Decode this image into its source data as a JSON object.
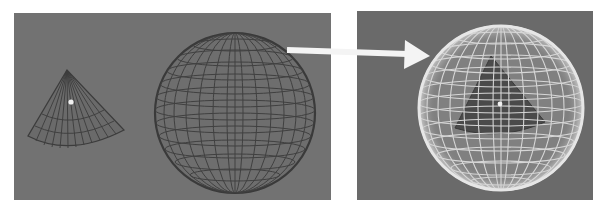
{
  "figure": {
    "colors": {
      "page_background": "#ffffff",
      "viewport_background": "#6e6e6e",
      "wire_dark": "#3a3a3a",
      "wire_light": "#e2e2e2",
      "arrow": "#f4f4f4",
      "pivot_dot": "#f0f0f0"
    },
    "panels": [
      {
        "id": "before",
        "label": "",
        "objects": [
          "cone-wireframe",
          "sphere-wireframe"
        ]
      },
      {
        "id": "after",
        "label": "",
        "objects": [
          "sphere-wireframe-light",
          "cone-inside-sphere"
        ]
      }
    ],
    "arrow": {
      "from": "sphere-wireframe",
      "to": "sphere-wireframe-light"
    }
  }
}
